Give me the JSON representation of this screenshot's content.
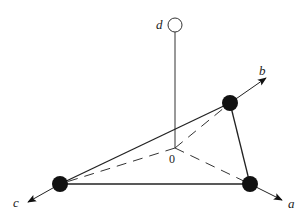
{
  "diagram": {
    "type": "tetrahedral-coordination",
    "labels": {
      "a": "a",
      "b": "b",
      "c": "c",
      "d": "d",
      "origin": "0"
    },
    "colors": {
      "line": "#222222",
      "ball_fill": "#111111",
      "open_circle_fill": "#ffffff",
      "background": "#ffffff"
    },
    "nodes": [
      {
        "id": "d",
        "x": 175,
        "y": 25,
        "r": 7,
        "filled": false
      },
      {
        "id": "b-vertex",
        "x": 230,
        "y": 103,
        "r": 8,
        "filled": true
      },
      {
        "id": "c-vertex",
        "x": 60,
        "y": 184,
        "r": 8,
        "filled": true
      },
      {
        "id": "a-vertex",
        "x": 250,
        "y": 184,
        "r": 8,
        "filled": true
      },
      {
        "id": "origin",
        "x": 175,
        "y": 148
      }
    ],
    "edges_solid": [
      [
        "c-vertex",
        "b-vertex"
      ],
      [
        "c-vertex",
        "a-vertex"
      ],
      [
        "b-vertex",
        "a-vertex"
      ],
      [
        "d",
        "origin"
      ]
    ],
    "edges_dashed": [
      [
        "origin",
        "b-vertex"
      ],
      [
        "origin",
        "c-vertex"
      ],
      [
        "origin",
        "a-vertex"
      ]
    ],
    "axes": [
      {
        "name": "a",
        "from": "a-vertex",
        "to": [
          282,
          200
        ]
      },
      {
        "name": "b",
        "from": "b-vertex",
        "to": [
          266,
          78
        ]
      },
      {
        "name": "c",
        "from": "c-vertex",
        "to": [
          28,
          202
        ]
      }
    ]
  }
}
